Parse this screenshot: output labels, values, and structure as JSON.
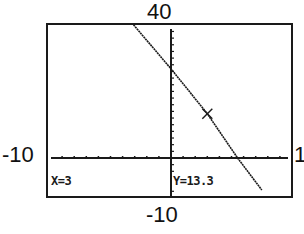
{
  "window": {
    "xmin_label": "-10",
    "xmax_label": "1",
    "ymin_label": "-10",
    "ymax_label": "40"
  },
  "trace": {
    "x_text": "X=3",
    "y_text": "Y=13.3",
    "x": 3,
    "y": 13.3
  },
  "colors": {
    "line": "#1a1a1a",
    "axis": "#1a1a1a",
    "background": "#ffffff"
  },
  "chart_data": {
    "type": "line",
    "title": "",
    "xlabel": "",
    "ylabel": "",
    "xlim": [
      -10,
      10
    ],
    "ylim": [
      -10,
      40
    ],
    "xscl": 1,
    "yscl": 2,
    "grid": false,
    "legend": null,
    "tick_labels": {
      "x_left": "-10",
      "x_right": "1",
      "y_top": "40",
      "y_bottom": "-10"
    },
    "series": [
      {
        "name": "Y1",
        "equation_estimate": "y ≈ -4.5x + 26.8",
        "x": [
          -3.1,
          0,
          3,
          5.5,
          7.5
        ],
        "y": [
          40,
          26.8,
          13.3,
          0,
          -9.6
        ]
      }
    ],
    "annotations": [
      {
        "type": "trace-cursor",
        "x": 3,
        "y": 13.3,
        "text": "X=3  Y=13.3"
      }
    ]
  }
}
